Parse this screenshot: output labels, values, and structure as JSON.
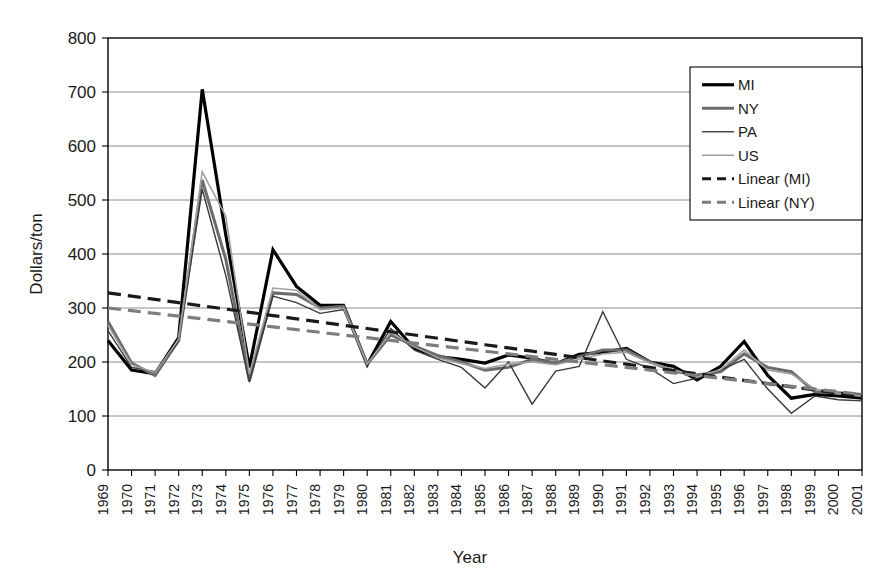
{
  "chart_data": {
    "type": "line",
    "title": "",
    "xlabel": "Year",
    "ylabel": "Dollars/ton",
    "xlim": [
      1969,
      2001
    ],
    "ylim": [
      0,
      800
    ],
    "ytick_step": 100,
    "yticks": [
      "0",
      "100",
      "200",
      "300",
      "400",
      "500",
      "600",
      "700",
      "800"
    ],
    "grid": true,
    "legend_position": "top-right",
    "x": [
      1969,
      1970,
      1971,
      1972,
      1973,
      1974,
      1975,
      1976,
      1977,
      1978,
      1979,
      1980,
      1981,
      1982,
      1983,
      1984,
      1985,
      1986,
      1987,
      1988,
      1989,
      1990,
      1991,
      1992,
      1993,
      1994,
      1995,
      1996,
      1997,
      1998,
      1999,
      2000,
      2001
    ],
    "xticks": [
      "1969",
      "1970",
      "1971",
      "1972",
      "1973",
      "1974",
      "1975",
      "1976",
      "1977",
      "1978",
      "1979",
      "1980",
      "1981",
      "1982",
      "1983",
      "1984",
      "1985",
      "1986",
      "1987",
      "1988",
      "1989",
      "1990",
      "1991",
      "1992",
      "1993",
      "1994",
      "1995",
      "1996",
      "1997",
      "1998",
      "1999",
      "2000",
      "2001"
    ],
    "series": [
      {
        "name": "MI",
        "color": "#000000",
        "width": 3.2,
        "dash": "none",
        "values": [
          240,
          185,
          178,
          245,
          705,
          435,
          190,
          408,
          340,
          305,
          305,
          195,
          275,
          225,
          210,
          205,
          198,
          213,
          207,
          197,
          214,
          218,
          225,
          200,
          192,
          167,
          192,
          238,
          175,
          133,
          140,
          137,
          133
        ]
      },
      {
        "name": "NY",
        "color": "#6b6b6b",
        "width": 3.0,
        "dash": "none",
        "values": [
          275,
          198,
          175,
          240,
          537,
          390,
          165,
          328,
          325,
          300,
          303,
          196,
          250,
          230,
          212,
          200,
          185,
          190,
          205,
          198,
          210,
          222,
          222,
          200,
          183,
          176,
          182,
          215,
          190,
          182,
          145,
          143,
          140
        ]
      },
      {
        "name": "PA",
        "color": "#3a3a3a",
        "width": 1.4,
        "dash": "none",
        "values": [
          258,
          190,
          182,
          238,
          520,
          360,
          163,
          322,
          310,
          290,
          297,
          194,
          262,
          222,
          205,
          190,
          152,
          200,
          122,
          183,
          192,
          293,
          205,
          188,
          160,
          170,
          185,
          205,
          150,
          105,
          137,
          130,
          128
        ]
      },
      {
        "name": "US",
        "color": "#a0a0a0",
        "width": 1.6,
        "dash": "none",
        "values": [
          268,
          195,
          180,
          242,
          552,
          470,
          178,
          337,
          333,
          297,
          300,
          196,
          255,
          228,
          208,
          197,
          188,
          196,
          200,
          195,
          205,
          215,
          218,
          198,
          186,
          172,
          186,
          222,
          185,
          178,
          150,
          142,
          136
        ]
      },
      {
        "name": "Linear (MI)",
        "color": "#1a1a1a",
        "width": 3.2,
        "dash": "13,7",
        "values": [
          328,
          322,
          316,
          310,
          304,
          298,
          292,
          286,
          280,
          274,
          268,
          262,
          256,
          250,
          244,
          238,
          232,
          226,
          220,
          214,
          208,
          202,
          196,
          190,
          184,
          178,
          172,
          166,
          160,
          154,
          148,
          142,
          136
        ]
      },
      {
        "name": "Linear (NY)",
        "color": "#7d7d7d",
        "width": 3.2,
        "dash": "13,7",
        "values": [
          300,
          295,
          290,
          285,
          280,
          275,
          270,
          265,
          260,
          255,
          250,
          245,
          240,
          235,
          230,
          225,
          220,
          215,
          210,
          205,
          200,
          195,
          190,
          185,
          180,
          175,
          170,
          165,
          160,
          155,
          150,
          145,
          140
        ]
      }
    ]
  },
  "legend": {
    "entries": [
      {
        "label": "MI"
      },
      {
        "label": "NY"
      },
      {
        "label": "PA"
      },
      {
        "label": "US"
      },
      {
        "label": "Linear (MI)"
      },
      {
        "label": "Linear (NY)"
      }
    ]
  },
  "axes": {
    "y_title": "Dollars/ton",
    "x_title": "Year"
  },
  "colors": {
    "background": "#ffffff",
    "grid": "#8c8c8c",
    "axis": "#000000",
    "text": "#1a1a1a"
  }
}
